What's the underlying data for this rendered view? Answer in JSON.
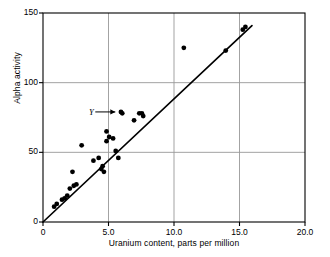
{
  "chart_data": {
    "type": "scatter",
    "title": "",
    "xlabel": "Uranium content, parts per million",
    "ylabel": "Alpha activity",
    "xlim": [
      0,
      20.0
    ],
    "ylim": [
      0,
      150
    ],
    "xticks": [
      "0",
      "5.0",
      "10.0",
      "15.0",
      "20.0"
    ],
    "xtick_values": [
      0,
      5,
      10,
      15,
      20
    ],
    "yticks": [
      "0",
      "50",
      "100",
      "150"
    ],
    "ytick_values": [
      0,
      50,
      100,
      150
    ],
    "grid": "major-xy-interior",
    "legend": "none",
    "annotations": [
      {
        "text": "Y",
        "points_to_x": 5.9,
        "points_to_y": 79,
        "style": "label-with-arrow"
      }
    ],
    "series": [
      {
        "name": "Uranium vs alpha activity",
        "marker": "filled-circle",
        "color": "#000000",
        "points": [
          [
            0.85,
            11
          ],
          [
            1.05,
            13
          ],
          [
            1.45,
            16
          ],
          [
            1.65,
            17
          ],
          [
            1.85,
            19
          ],
          [
            2.05,
            24
          ],
          [
            2.25,
            36
          ],
          [
            2.35,
            26
          ],
          [
            2.55,
            27
          ],
          [
            2.95,
            55
          ],
          [
            3.85,
            44
          ],
          [
            4.25,
            46
          ],
          [
            4.45,
            38
          ],
          [
            4.55,
            40
          ],
          [
            4.65,
            36
          ],
          [
            4.85,
            65
          ],
          [
            4.85,
            58
          ],
          [
            5.05,
            61
          ],
          [
            5.35,
            60
          ],
          [
            5.55,
            51
          ],
          [
            5.75,
            46
          ],
          [
            5.95,
            79
          ],
          [
            6.05,
            78
          ],
          [
            6.95,
            73
          ],
          [
            7.35,
            78
          ],
          [
            7.55,
            78
          ],
          [
            7.65,
            76
          ],
          [
            10.75,
            125
          ],
          [
            13.95,
            123
          ],
          [
            15.25,
            138
          ],
          [
            15.45,
            140
          ]
        ]
      }
    ],
    "fit_line": {
      "name": "regression-line",
      "color": "#000000",
      "x_start": 0.0,
      "y_start": 0,
      "x_end": 15.95,
      "y_end": 141
    }
  }
}
